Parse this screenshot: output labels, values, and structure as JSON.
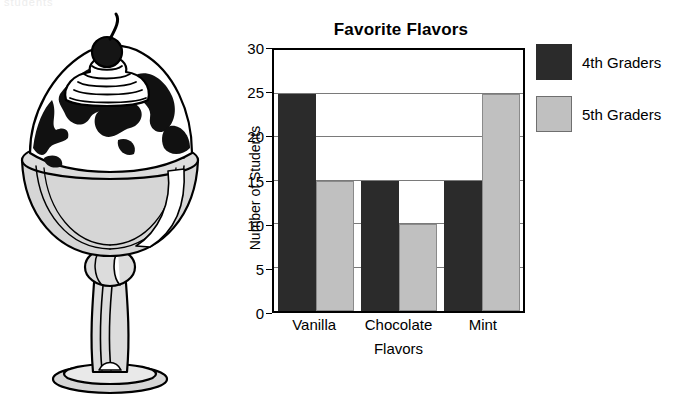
{
  "page": {
    "cropped_text_fragment": "students"
  },
  "illustration": {
    "name": "ice-cream-sundae",
    "parts": [
      "cherry",
      "whipped-cream-swirl",
      "chocolate-sauce",
      "ice-cream-scoop",
      "glass-goblet",
      "stem",
      "base"
    ]
  },
  "legend": {
    "position": "right",
    "items": [
      {
        "label": "4th Graders",
        "color": "#2b2b2b"
      },
      {
        "label": "5th Graders",
        "color": "#c0c0c0"
      }
    ]
  },
  "chart_data": {
    "type": "bar",
    "title": "Favorite Flavors",
    "xlabel": "Flavors",
    "ylabel": "Number of Students",
    "categories": [
      "Vanilla",
      "Chocolate",
      "Mint"
    ],
    "series": [
      {
        "name": "4th Graders",
        "color": "#2b2b2b",
        "values": [
          25,
          15,
          15
        ]
      },
      {
        "name": "5th Graders",
        "color": "#c0c0c0",
        "values": [
          15,
          10,
          25
        ]
      }
    ],
    "ylim": [
      0,
      30
    ],
    "yticks": [
      0,
      5,
      10,
      15,
      20,
      25,
      30
    ],
    "grid": true,
    "legend_position": "right"
  }
}
